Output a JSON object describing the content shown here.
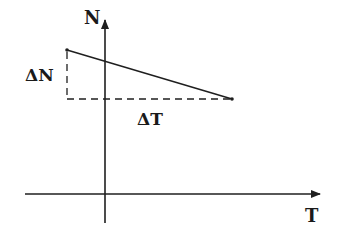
{
  "diagram": {
    "axes": {
      "vertical_label": "N",
      "horizontal_label": "T"
    },
    "annotations": {
      "delta_n_label": "ΔN",
      "delta_t_label": "ΔT"
    },
    "colors": {
      "ink": "#1f1f1f",
      "background": "#ffffff"
    }
  }
}
